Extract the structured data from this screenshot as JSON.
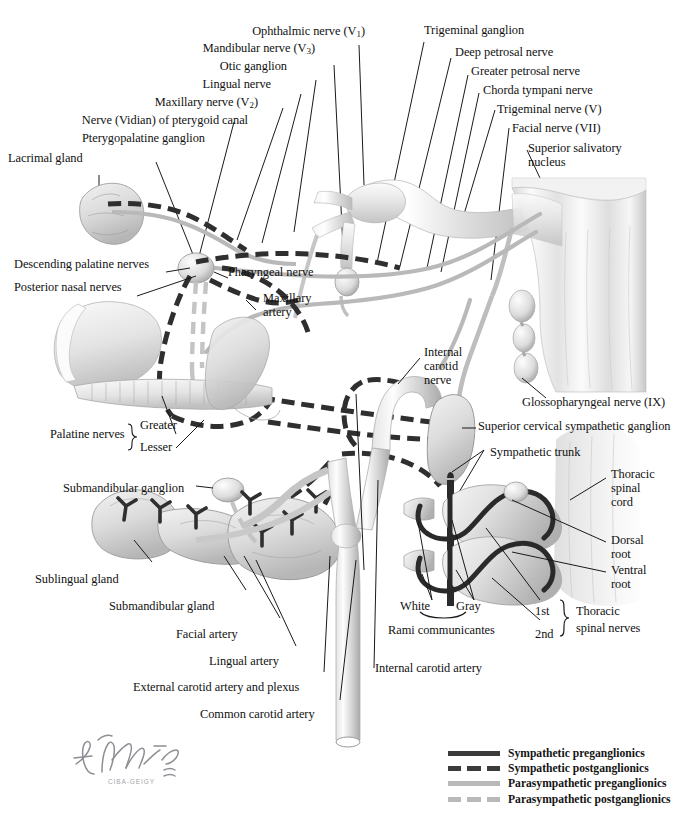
{
  "plate": {
    "title": "Autonomic Nerves of the Head",
    "background": "#ffffff",
    "ink": "#111111"
  },
  "signature": {
    "artist": "F. Netter",
    "credential": "M.D.",
    "publisher": "CIBA-GEIGY"
  },
  "labels": {
    "ophthalmic_nerve": "Ophthalmic nerve (V",
    "ophthalmic_sub": "1",
    "ophthalmic_tail": ")",
    "mandibular_nerve": "Mandibular nerve (V",
    "mandibular_sub": "3",
    "mandibular_tail": ")",
    "otic_ganglion": "Otic ganglion",
    "lingual_nerve": "Lingual nerve",
    "maxillary_nerve": "Maxillary nerve (V",
    "maxillary_sub": "2",
    "maxillary_tail": ")",
    "vidian_nerve": "Nerve (Vidian) of pterygoid canal",
    "pterygopalatine_ganglion": "Pterygopalatine ganglion",
    "lacrimal_gland": "Lacrimal gland",
    "trigeminal_ganglion": "Trigeminal ganglion",
    "deep_petrosal_nerve": "Deep petrosal nerve",
    "greater_petrosal_nerve": "Greater petrosal nerve",
    "chorda_tympani_nerve": "Chorda tympani nerve",
    "trigeminal_nerve": "Trigeminal nerve (V)",
    "facial_nerve": "Facial nerve (VII)",
    "superior_salivatory_nucleus_l1": "Superior salivatory",
    "superior_salivatory_nucleus_l2": "nucleus",
    "descending_palatine_nerves": "Descending palatine nerves",
    "posterior_nasal_nerves": "Posterior nasal nerves",
    "pharyngeal_nerve": "Pharyngeal nerve",
    "maxillary_artery_l1": "Maxillary",
    "maxillary_artery_l2": "artery",
    "internal_carotid_nerve_l1": "Internal",
    "internal_carotid_nerve_l2": "carotid",
    "internal_carotid_nerve_l3": "nerve",
    "palatine_nerves": "Palatine nerves",
    "palatine_greater": "Greater",
    "palatine_lesser": "Lesser",
    "glossopharyngeal_nerve": "Glossopharyngeal nerve (IX)",
    "superior_cervical_ganglion": "Superior cervical sympathetic ganglion",
    "sympathetic_trunk": "Sympathetic trunk",
    "thoracic_spinal_cord_l1": "Thoracic",
    "thoracic_spinal_cord_l2": "spinal",
    "thoracic_spinal_cord_l3": "cord",
    "dorsal_root_l1": "Dorsal",
    "dorsal_root_l2": "root",
    "ventral_root_l1": "Ventral",
    "ventral_root_l2": "root",
    "submandibular_ganglion": "Submandibular ganglion",
    "sublingual_gland": "Sublingual gland",
    "submandibular_gland": "Submandibular gland",
    "facial_artery": "Facial artery",
    "lingual_artery": "Lingual artery",
    "external_carotid": "External carotid artery and plexus",
    "common_carotid": "Common carotid artery",
    "internal_carotid_artery": "Internal carotid artery",
    "rami_white": "White",
    "rami_gray": "Gray",
    "rami_communicantes": "Rami communicantes",
    "nerve_1st": "1st",
    "nerve_2nd": "2nd",
    "thoracic_spinal_nerves_l1": "Thoracic",
    "thoracic_spinal_nerves_l2": "spinal nerves"
  },
  "legend": {
    "items": [
      {
        "label": "Sympathetic preganglionics",
        "style": "solid-dark",
        "color": "#3b3b3b"
      },
      {
        "label": "Sympathetic postganglionics",
        "style": "dashed-dark",
        "color": "#3b3b3b"
      },
      {
        "label": "Parasympathetic preganglionics",
        "style": "solid-light",
        "color": "#b9b9b9"
      },
      {
        "label": "Parasympathetic postganglionics",
        "style": "dashed-light",
        "color": "#b9b9b9"
      }
    ]
  }
}
